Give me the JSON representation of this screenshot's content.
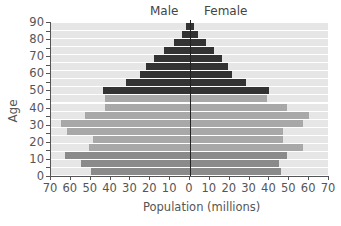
{
  "chart_data": {
    "type": "bar",
    "orientation": "horizontal-population-pyramid",
    "title": "",
    "labels": {
      "left": "Male",
      "right": "Female"
    },
    "xlabel": "Population (millions)",
    "ylabel": "Age",
    "xlim": [
      -70,
      70
    ],
    "ylim": [
      0,
      90
    ],
    "x_ticks": [
      "70",
      "60",
      "50",
      "40",
      "30",
      "20",
      "10",
      "0",
      "10",
      "20",
      "30",
      "40",
      "50",
      "60",
      "70"
    ],
    "y_ticks": [
      "0",
      "10",
      "20",
      "30",
      "40",
      "50",
      "60",
      "70",
      "80",
      "90"
    ],
    "categories": [
      "0-4",
      "5-9",
      "10-14",
      "15-19",
      "20-24",
      "25-29",
      "30-34",
      "35-39",
      "40-44",
      "45-49",
      "50-54",
      "55-59",
      "60-64",
      "65-69",
      "70-74",
      "75-79",
      "80-84",
      "85-89",
      "90+"
    ],
    "series": [
      {
        "name": "Male",
        "values": [
          50,
          55,
          63,
          51,
          49,
          62,
          65,
          53,
          43,
          43,
          44,
          32,
          25,
          22,
          18,
          13,
          8,
          4,
          2
        ]
      },
      {
        "name": "Female",
        "values": [
          46,
          45,
          49,
          57,
          47,
          47,
          57,
          60,
          49,
          39,
          40,
          28,
          21,
          19,
          16,
          12,
          8,
          4,
          2
        ]
      }
    ],
    "bar_shades": [
      "#8a8a8a",
      "#8a8a8a",
      "#8a8a8a",
      "#a8a8a8",
      "#a8a8a8",
      "#a8a8a8",
      "#a8a8a8",
      "#a8a8a8",
      "#a8a8a8",
      "#a8a8a8",
      "#333333",
      "#333333",
      "#333333",
      "#333333",
      "#333333",
      "#333333",
      "#333333",
      "#333333",
      "#333333"
    ],
    "grid": false,
    "legend": "none"
  },
  "colors": {
    "dark_bar": "#333333",
    "mid_bar": "#8a8a8a",
    "light_bar": "#a8a8a8",
    "stripe": "#e6e6e6"
  }
}
